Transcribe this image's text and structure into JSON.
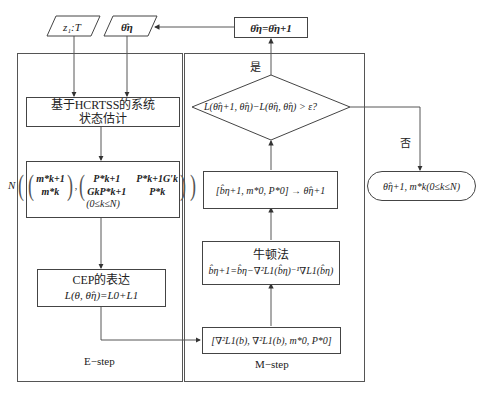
{
  "diagram": {
    "inputs": {
      "observations": "z₁:T",
      "theta_eta": "θ̂η"
    },
    "update_box": "θ̂η=θ̂η+1",
    "e_step": {
      "label": "E−step",
      "state_estimation": {
        "line1": "基于HCRTSS的系统",
        "line2": "状态估计"
      },
      "distribution": {
        "prefix": "N",
        "mean_vector": [
          "m*k+1",
          "m*k"
        ],
        "covariance": [
          [
            "P*k+1",
            "P*k+1G′k"
          ],
          [
            "GkP*k+1",
            "P*k"
          ]
        ],
        "range": "(0≤k≤N)"
      },
      "cep": {
        "title": "CEP的表达",
        "formula": "L(θ, θ̂η)=L0+L1"
      }
    },
    "m_step": {
      "label": "M−step",
      "gradient_box": "[∇²L1(b), ∇²L1(b),  m*0,  P*0]",
      "newton": {
        "title": "牛顿法",
        "formula": "b̂η+1=b̂η−∇²L1(b̂η)⁻¹∇L1(b̂η)"
      },
      "assemble_box": "[b̂η+1,  m*0,  P*0] → θ̂η+1",
      "decision": "L(θ̂η+1, θ̂η)−L(θ̂η, θ̂η) > ε?"
    },
    "branches": {
      "yes": "是",
      "no": "否"
    },
    "output": "θ̂η+1,  m*k(0≤k≤N)",
    "colors": {
      "line": "#444444",
      "frame": "#555555",
      "background": "#ffffff"
    }
  }
}
